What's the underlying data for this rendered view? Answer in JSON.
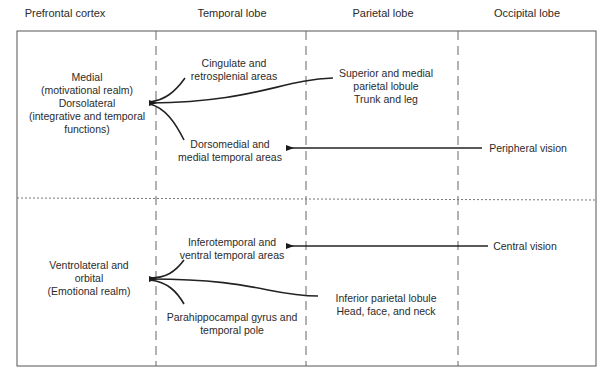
{
  "columns": [
    {
      "label": "Prefrontal cortex",
      "x": 65
    },
    {
      "label": "Temporal lobe",
      "x": 232
    },
    {
      "label": "Parietal lobe",
      "x": 383
    },
    {
      "label": "Occipital lobe",
      "x": 527
    }
  ],
  "upper": {
    "prefrontal": {
      "lines": [
        "Medial",
        "(motivational realm)",
        "Dorsolateral",
        "(integrative and temporal",
        "functions)"
      ]
    },
    "temporal_top": {
      "lines": [
        "Cingulate and",
        "retrosplenial areas"
      ]
    },
    "temporal_bottom": {
      "lines": [
        "Dorsomedial and",
        "medial temporal areas"
      ]
    },
    "parietal": {
      "lines": [
        "Superior and medial",
        "parietal lobule",
        "Trunk and leg"
      ]
    },
    "occipital": {
      "lines": [
        "Peripheral vision"
      ]
    }
  },
  "lower": {
    "prefrontal": {
      "lines": [
        "Ventrolateral and",
        "orbital",
        "(Emotional realm)"
      ]
    },
    "temporal_top": {
      "lines": [
        "Inferotemporal and",
        "ventral temporal areas"
      ]
    },
    "temporal_bottom": {
      "lines": [
        "Parahippocampal gyrus and",
        "temporal pole"
      ]
    },
    "parietal": {
      "lines": [
        "Inferior parietal lobule",
        "Head, face, and neck"
      ]
    },
    "occipital": {
      "lines": [
        "Central vision"
      ]
    }
  },
  "colors": {
    "line": "#2a2a2a",
    "frame": "#555555",
    "divider": "#666666"
  }
}
